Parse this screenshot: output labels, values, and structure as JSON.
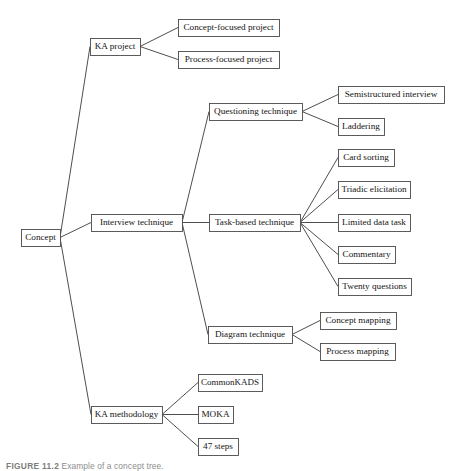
{
  "figure": {
    "caption_label": "FIGURE 11.2",
    "caption_text": "Example of a concept tree.",
    "width": 466,
    "height": 471,
    "background_color": "#ffffff",
    "line_color": "#3a3a3a",
    "box_stroke_color": "#4a4a4a",
    "text_color": "#141414"
  },
  "chart_data": {
    "type": "diagram",
    "diagram_kind": "tree",
    "orientation": "left-to-right",
    "title": "Example of a concept tree",
    "root": "Concept",
    "nodes": [
      {
        "id": "concept",
        "label": "Concept",
        "level": 0,
        "x": 21,
        "y": 229,
        "w": 39,
        "h": 17
      },
      {
        "id": "ka-project",
        "label": "KA project",
        "level": 1,
        "x": 90,
        "y": 38,
        "w": 50,
        "h": 17
      },
      {
        "id": "interview-technique",
        "label": "Interview technique",
        "level": 1,
        "x": 91,
        "y": 214,
        "w": 91,
        "h": 17
      },
      {
        "id": "ka-methodology",
        "label": "KA methodology",
        "level": 1,
        "x": 91,
        "y": 406,
        "w": 71,
        "h": 17
      },
      {
        "id": "concept-focused-project",
        "label": "Concept-focused project",
        "level": 2,
        "x": 178,
        "y": 19,
        "w": 101,
        "h": 17
      },
      {
        "id": "process-focused-project",
        "label": "Process-focused project",
        "level": 2,
        "x": 178,
        "y": 51,
        "w": 101,
        "h": 17
      },
      {
        "id": "questioning-technique",
        "label": "Questioning technique",
        "level": 2,
        "x": 209,
        "y": 103,
        "w": 93,
        "h": 17
      },
      {
        "id": "task-based-technique",
        "label": "Task-based technique",
        "level": 2,
        "x": 209,
        "y": 214,
        "w": 91,
        "h": 17
      },
      {
        "id": "diagram-technique",
        "label": "Diagram technique",
        "level": 2,
        "x": 208,
        "y": 326,
        "w": 84,
        "h": 17
      },
      {
        "id": "semistructured-interview",
        "label": "Semistructured interview",
        "level": 3,
        "x": 338,
        "y": 86,
        "w": 106,
        "h": 17
      },
      {
        "id": "laddering",
        "label": "Laddering",
        "level": 3,
        "x": 338,
        "y": 118,
        "w": 46,
        "h": 17
      },
      {
        "id": "card-sorting",
        "label": "Card sorting",
        "level": 3,
        "x": 338,
        "y": 149,
        "w": 56,
        "h": 17
      },
      {
        "id": "triadic-elicitation",
        "label": "Triadic elicitation",
        "level": 3,
        "x": 338,
        "y": 181,
        "w": 72,
        "h": 17
      },
      {
        "id": "limited-data-task",
        "label": "Limited data task",
        "level": 3,
        "x": 338,
        "y": 214,
        "w": 72,
        "h": 17
      },
      {
        "id": "commentary",
        "label": "Commentary",
        "level": 3,
        "x": 338,
        "y": 246,
        "w": 57,
        "h": 17
      },
      {
        "id": "twenty-questions",
        "label": "Twenty questions",
        "level": 3,
        "x": 338,
        "y": 278,
        "w": 73,
        "h": 17
      },
      {
        "id": "concept-mapping",
        "label": "Concept mapping",
        "level": 3,
        "x": 320,
        "y": 312,
        "w": 76,
        "h": 17
      },
      {
        "id": "process-mapping",
        "label": "Process mapping",
        "level": 3,
        "x": 320,
        "y": 343,
        "w": 75,
        "h": 17
      },
      {
        "id": "commonkads",
        "label": "CommonKADS",
        "level": 2,
        "x": 198,
        "y": 374,
        "w": 64,
        "h": 17
      },
      {
        "id": "moka",
        "label": "MOKA",
        "level": 2,
        "x": 198,
        "y": 406,
        "w": 35,
        "h": 17
      },
      {
        "id": "47-steps",
        "label": "47 steps",
        "level": 2,
        "x": 198,
        "y": 438,
        "w": 40,
        "h": 17
      }
    ],
    "edges": [
      {
        "from": "concept",
        "to": "ka-project"
      },
      {
        "from": "concept",
        "to": "interview-technique"
      },
      {
        "from": "concept",
        "to": "ka-methodology"
      },
      {
        "from": "ka-project",
        "to": "concept-focused-project"
      },
      {
        "from": "ka-project",
        "to": "process-focused-project"
      },
      {
        "from": "interview-technique",
        "to": "questioning-technique"
      },
      {
        "from": "interview-technique",
        "to": "task-based-technique"
      },
      {
        "from": "interview-technique",
        "to": "diagram-technique"
      },
      {
        "from": "questioning-technique",
        "to": "semistructured-interview"
      },
      {
        "from": "questioning-technique",
        "to": "laddering"
      },
      {
        "from": "task-based-technique",
        "to": "card-sorting"
      },
      {
        "from": "task-based-technique",
        "to": "triadic-elicitation"
      },
      {
        "from": "task-based-technique",
        "to": "limited-data-task"
      },
      {
        "from": "task-based-technique",
        "to": "commentary"
      },
      {
        "from": "task-based-technique",
        "to": "twenty-questions"
      },
      {
        "from": "diagram-technique",
        "to": "concept-mapping"
      },
      {
        "from": "diagram-technique",
        "to": "process-mapping"
      },
      {
        "from": "ka-methodology",
        "to": "commonkads"
      },
      {
        "from": "ka-methodology",
        "to": "moka"
      },
      {
        "from": "ka-methodology",
        "to": "47-steps"
      }
    ]
  }
}
